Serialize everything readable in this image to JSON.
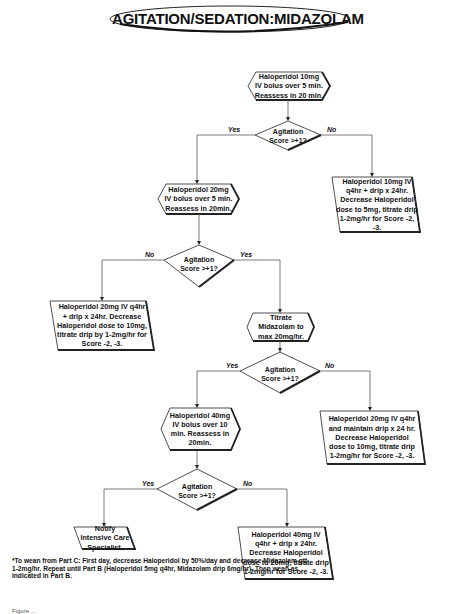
{
  "title": "AGITATION/SEDATION:MIDAZOLAM",
  "nodes": {
    "start": [
      "Haloperidol 10mg",
      "IV bolus over 5 min.",
      "Reassess in 20 min."
    ],
    "step2": [
      "Haloperidol 20mg",
      "IV bolus over 5 min.",
      "Reassess in 20min."
    ],
    "no1": [
      "Haloperidol 10mg IV",
      "q4hr + drip x 24hr.",
      "Decrease Haloperidol",
      "dose to 5mg, titrate drip",
      "1-2mg/hr for Score -2, -3."
    ],
    "no2": [
      "Haloperidol 20mg IV q4hr",
      "+ drip x 24hr. Decrease",
      "Haloperidol dose to 10mg,",
      "titrate drip by 1-2mg/hr for",
      "Score -2, -3."
    ],
    "step3": [
      "Titrate",
      "Midazolam to",
      "max 20mg/hr."
    ],
    "no3": [
      "Haloperidol 20mg IV q4hr",
      "and maintain drip x 24 hr.",
      "Decrease Haloperidol",
      "dose to 10mg, titrate drip",
      "1-2mg/hr for Score -2, -3."
    ],
    "step4": [
      "Haloperidol 40mg",
      "IV bolus over 10",
      "min. Reassess in",
      "20min."
    ],
    "yes4": [
      "Notify",
      "Intensive Care",
      "Specialist."
    ],
    "no4": [
      "Haloperidol 40mg IV",
      "q4hr + drip x 24hr.",
      "Decrease Haloperidol",
      "dose to 20mg, titrate drip",
      "1-2mg/hr for Score -2, -3."
    ]
  },
  "decision": {
    "line1": "Agitation",
    "line2": "Score >+1?"
  },
  "branch_labels": {
    "yes": "Yes",
    "no": "No"
  },
  "footnote": "*To wean from Part C: First day, decrease Haloperidol by 50%/day and decrease Midazolam gtt 1-2mg/hr. Repeat until Part B (Haloperidol 5mg q4hr, Midazolam drip 6mg/hr). Then wean as indicated in Part B.",
  "caption": "Figure ..."
}
